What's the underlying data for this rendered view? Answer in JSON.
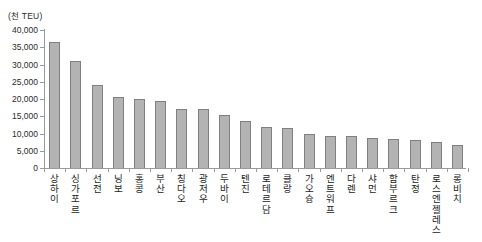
{
  "chart_data": {
    "type": "bar",
    "title": "",
    "subtitle": "",
    "unit_label": "(천 TEU)",
    "xlabel": "",
    "ylabel": "",
    "ylim": [
      0,
      40000
    ],
    "ytick_step": 5000,
    "ytick_labels": [
      "40,000",
      "35,000",
      "30,000",
      "25,000",
      "20,000",
      "15,000",
      "10,000",
      "5,000",
      "0"
    ],
    "ytick_values": [
      40000,
      35000,
      30000,
      25000,
      20000,
      15000,
      10000,
      5000,
      0
    ],
    "grid": false,
    "legend": false,
    "legend_position": "none",
    "orientation": "vertical",
    "bar_color": "#b3b3b3",
    "bar_border_color": "#808080",
    "axis_color": "#9a9a9a",
    "categories": [
      "상하이",
      "싱가포르",
      "선전",
      "닝보",
      "홍콩",
      "부산",
      "칭다오",
      "광저우",
      "두바이",
      "텐진",
      "로테르담",
      "클랑",
      "가오슝",
      "엔트워프",
      "다렌",
      "샤먼",
      "함부르크",
      "탄정",
      "로스엔젤레스",
      "롱비치"
    ],
    "values": [
      36500,
      30900,
      24000,
      20600,
      20000,
      19300,
      17100,
      17000,
      15400,
      13600,
      11900,
      11500,
      9900,
      9200,
      9200,
      8700,
      8400,
      8100,
      7600,
      6600
    ]
  }
}
